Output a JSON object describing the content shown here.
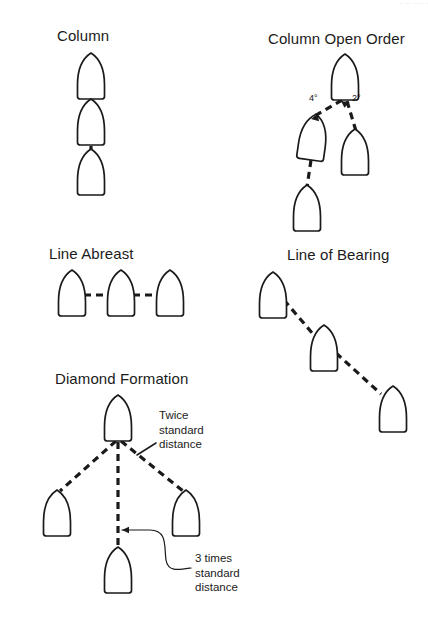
{
  "page": {
    "kind": "naval-formation-diagram",
    "width": 428,
    "height": 621,
    "background": "#ffffff",
    "ink": "#1a1a1a",
    "cropped_header_text": "·· ·· ····· ·"
  },
  "figures": [
    {
      "id": "column",
      "title": "Column",
      "title_x": 57,
      "title_y": 27,
      "ships": [
        {
          "cx": 91,
          "cy": 76,
          "rot": 0
        },
        {
          "cx": 91,
          "cy": 122,
          "rot": 0
        },
        {
          "cx": 91,
          "cy": 172,
          "rot": 0
        }
      ],
      "links": [
        {
          "x1": 91,
          "y1": 99,
          "x2": 91,
          "y2": 104
        },
        {
          "x1": 91,
          "y1": 146,
          "x2": 91,
          "y2": 152
        }
      ]
    },
    {
      "id": "column-open-order",
      "title": "Column Open Order",
      "title_x": 268,
      "title_y": 30,
      "ships": [
        {
          "cx": 345,
          "cy": 77,
          "rot": 0
        },
        {
          "cx": 313,
          "cy": 137,
          "rot": 8
        },
        {
          "cx": 355,
          "cy": 152,
          "rot": 0
        },
        {
          "cx": 307,
          "cy": 208,
          "rot": 0
        }
      ],
      "links": [
        {
          "x1": 342,
          "y1": 100,
          "x2": 311,
          "y2": 118
        },
        {
          "x1": 347,
          "y1": 101,
          "x2": 356,
          "y2": 131
        },
        {
          "x1": 311,
          "y1": 160,
          "x2": 307,
          "y2": 187
        }
      ],
      "angles": [
        {
          "text": "4°",
          "x": 309,
          "y": 93
        },
        {
          "text": "2°",
          "x": 352,
          "y": 93
        }
      ]
    },
    {
      "id": "line-abreast",
      "title": "Line Abreast",
      "title_x": 49,
      "title_y": 245,
      "ships": [
        {
          "cx": 72,
          "cy": 293,
          "rot": 0
        },
        {
          "cx": 121,
          "cy": 293,
          "rot": 0
        },
        {
          "cx": 170,
          "cy": 293,
          "rot": 0
        }
      ],
      "links": [
        {
          "x1": 84,
          "y1": 295,
          "x2": 109,
          "y2": 295
        },
        {
          "x1": 133,
          "y1": 295,
          "x2": 158,
          "y2": 295
        }
      ]
    },
    {
      "id": "line-of-bearing",
      "title": "Line of Bearing",
      "title_x": 287,
      "title_y": 246,
      "ships": [
        {
          "cx": 273,
          "cy": 295,
          "rot": 0
        },
        {
          "cx": 324,
          "cy": 348,
          "rot": 0
        },
        {
          "cx": 393,
          "cy": 409,
          "rot": 0
        }
      ],
      "links": [
        {
          "x1": 284,
          "y1": 300,
          "x2": 313,
          "y2": 334
        },
        {
          "x1": 336,
          "y1": 353,
          "x2": 381,
          "y2": 394
        }
      ]
    },
    {
      "id": "diamond-formation",
      "title": "Diamond Formation",
      "title_x": 55,
      "title_y": 370,
      "ships": [
        {
          "cx": 118,
          "cy": 418,
          "rot": 0
        },
        {
          "cx": 57,
          "cy": 513,
          "rot": 0
        },
        {
          "cx": 186,
          "cy": 513,
          "rot": 0
        },
        {
          "cx": 118,
          "cy": 570,
          "rot": 0
        }
      ],
      "links": [
        {
          "x1": 116,
          "y1": 441,
          "x2": 60,
          "y2": 491
        },
        {
          "x1": 121,
          "y1": 441,
          "x2": 183,
          "y2": 491
        },
        {
          "x1": 118,
          "y1": 442,
          "x2": 118,
          "y2": 547
        }
      ],
      "annotations": [
        {
          "id": "twice-standard-distance",
          "lines": [
            "Twice",
            "standard",
            "distance"
          ],
          "x": 159,
          "y": 408,
          "leader": {
            "x1": 156,
            "y1": 443,
            "x2": 137,
            "y2": 455
          }
        },
        {
          "id": "three-times-standard-distance",
          "lines": [
            "3 times",
            "standard",
            "distance"
          ],
          "x": 195,
          "y": 551,
          "leader_path": "M 122 530 L 150 530 C 168 530 164 548 166 560 C 168 572 178 570 191 568",
          "arrow_at": {
            "x": 122,
            "y": 530
          }
        }
      ]
    }
  ],
  "style": {
    "dash_pattern": "7 5",
    "dash_width": 3.2,
    "hull_stroke": 1.7,
    "hull_color": "#1a1a1a",
    "hull_fill": "#ffffff"
  }
}
